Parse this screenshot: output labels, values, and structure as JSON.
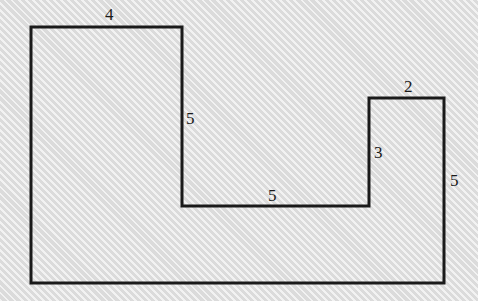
{
  "figure": {
    "shape_type": "polygon",
    "background_color": "#e3e3e3",
    "stroke_color": "#1a1a1a",
    "stroke_width": 3,
    "fill": "none",
    "vertices": [
      [
        31,
        27
      ],
      [
        182,
        27
      ],
      [
        182,
        206
      ],
      [
        369,
        206
      ],
      [
        369,
        98
      ],
      [
        444,
        98
      ],
      [
        444,
        283
      ],
      [
        31,
        283
      ]
    ],
    "labels": [
      {
        "name": "top-left-width",
        "text": "4",
        "x": 105,
        "y": 6,
        "edge": "top of left tower, from (31,27) to (182,27)"
      },
      {
        "name": "left-tower-right-height",
        "text": "5",
        "x": 186,
        "y": 110,
        "edge": "right side of left tower, from (182,27) to (182,206)"
      },
      {
        "name": "middle-bottom-width",
        "text": "5",
        "x": 268,
        "y": 187,
        "edge": "inner horizontal, from (182,206) to (369,206)"
      },
      {
        "name": "right-tower-left-height",
        "text": "3",
        "x": 374,
        "y": 144,
        "edge": "left side of right tower, from (369,206) to (369,98)"
      },
      {
        "name": "right-tower-top-width",
        "text": "2",
        "x": 404,
        "y": 78,
        "edge": "top of right tower, from (369,98) to (444,98)"
      },
      {
        "name": "right-side-height",
        "text": "5",
        "x": 450,
        "y": 172,
        "edge": "far right side, from (444,98) to (444,283)"
      }
    ]
  }
}
